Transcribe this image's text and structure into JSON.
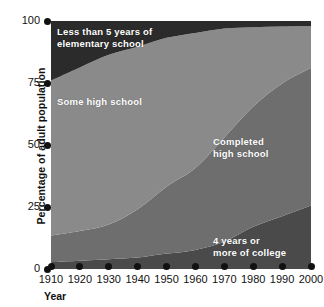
{
  "chart_data": {
    "type": "area",
    "title": "",
    "xlabel": "Year",
    "ylabel": "Percentage of adult population",
    "ylim": [
      0,
      100
    ],
    "xlim": [
      1910,
      2000
    ],
    "grid": false,
    "legend_position": "inside-bands",
    "stacked": true,
    "x": [
      1910,
      1920,
      1930,
      1940,
      1950,
      1960,
      1970,
      1980,
      1990,
      2000
    ],
    "xtick_labels": [
      "1910",
      "1920",
      "1930",
      "1940",
      "1950",
      "1960",
      "1970",
      "1980",
      "1990",
      "2000"
    ],
    "ytick_labels": [
      "0",
      "25",
      "50",
      "75",
      "100"
    ],
    "ytick_values": [
      0,
      25,
      50,
      75,
      100
    ],
    "series": [
      {
        "name": "4 years or more of college",
        "color": "#4a4a4a",
        "values": [
          2.7,
          3.3,
          3.9,
          4.6,
          6.2,
          7.7,
          11.0,
          17.0,
          21.3,
          25.6
        ]
      },
      {
        "name": "Completed high school",
        "color": "#6e6e6e",
        "values": [
          10.8,
          12.0,
          14.0,
          19.5,
          27.0,
          33.0,
          42.0,
          48.5,
          53.5,
          55.5
        ]
      },
      {
        "name": "Some high school",
        "color": "#8a8a8a",
        "values": [
          62.5,
          66.0,
          68.5,
          65.5,
          60.0,
          54.5,
          44.0,
          32.0,
          23.0,
          16.9
        ]
      },
      {
        "name": "Less than 5 years of elementary school",
        "color": "#2b2b2b",
        "values": [
          24.0,
          18.7,
          13.6,
          10.4,
          6.8,
          4.8,
          3.0,
          2.5,
          2.2,
          2.0
        ]
      }
    ]
  },
  "band_labels": {
    "elementary": "Less than 5 years of\nelementary school",
    "some_high_school": "Some high school",
    "completed_high_school": "Completed\nhigh school",
    "college": "4 years or\nmore of college"
  },
  "axes": {
    "y_title": "Percentage of adult population",
    "x_title": "Year"
  },
  "colors": {
    "background": "#ffffff",
    "axis_text": "#111111",
    "band_elementary": "#2b2b2b",
    "band_some_high_school": "#8a8a8a",
    "band_completed_high_school": "#6e6e6e",
    "band_college": "#4a4a4a",
    "label_text": "#ffffff"
  }
}
